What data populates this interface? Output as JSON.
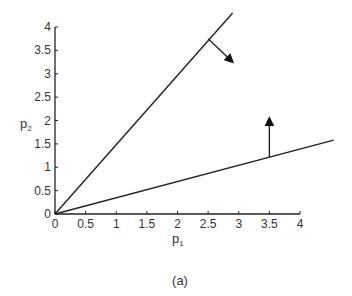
{
  "chart_data": {
    "type": "line",
    "title": "",
    "caption": "(a)",
    "xlabel": "p",
    "xlabel_sub": "1",
    "ylabel": "p",
    "ylabel_sub": "2",
    "xlim": [
      0,
      4
    ],
    "ylim": [
      0,
      4
    ],
    "xticks": [
      "0",
      "0.5",
      "1",
      "1.5",
      "2",
      "2.5",
      "3",
      "3.5",
      "4"
    ],
    "yticks": [
      "0",
      "0.5",
      "1",
      "1.5",
      "2",
      "2.5",
      "3",
      "3.5",
      "4"
    ],
    "grid": false,
    "series": [
      {
        "name": "steep boundary line",
        "x": [
          0,
          2.9
        ],
        "values": [
          0,
          4.3
        ],
        "slope": 1.5
      },
      {
        "name": "shallow boundary line",
        "x": [
          0,
          4.55
        ],
        "values": [
          0,
          1.58
        ],
        "slope": 0.35
      }
    ],
    "annotations": [
      {
        "type": "arrow",
        "from": [
          2.5,
          3.75
        ],
        "to": [
          2.9,
          3.25
        ],
        "direction": "down-right",
        "attached_to": "steep boundary line"
      },
      {
        "type": "arrow",
        "from": [
          3.5,
          1.22
        ],
        "to": [
          3.5,
          2.05
        ],
        "direction": "up",
        "attached_to": "shallow boundary line"
      }
    ]
  }
}
